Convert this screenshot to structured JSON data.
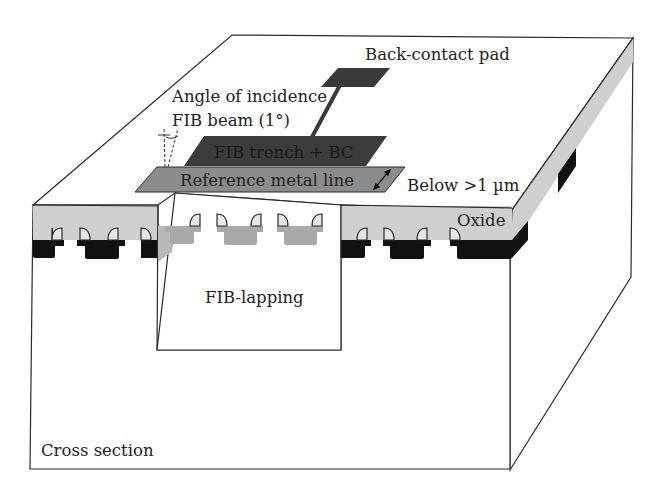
{
  "figure": {
    "labels": {
      "back_contact_pad": "Back-contact pad",
      "angle_line1": "Angle of incidence",
      "angle_line2": "FIB beam (1°)",
      "fib_trench": "FIB trench + BC",
      "reference_metal_line": "Reference metal line",
      "below": "Below >1 µm",
      "oxide": "Oxide",
      "fib_lapping": "FIB-lapping",
      "cross_section": "Cross section"
    },
    "colors": {
      "outline": "#2a2a2a",
      "oxide": "#cfcfcf",
      "metal_dark": "#111111",
      "metal_exposed": "#a9a9a9",
      "trench": "#3c3c3c",
      "reference_line": "#8c8c8c",
      "pad": "#3a3a3a",
      "background": "#ffffff"
    }
  }
}
